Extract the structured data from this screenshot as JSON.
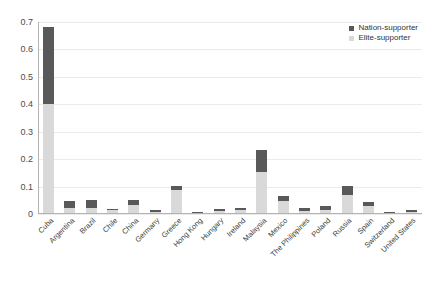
{
  "chart_data": {
    "type": "bar",
    "stacked": true,
    "title": "",
    "subtitle": "",
    "xlabel": "",
    "ylabel": "",
    "ylim": [
      0,
      0.7
    ],
    "ytick_labels": [
      "0",
      "0.1",
      "0.2",
      "0.3",
      "0.4",
      "0.5",
      "0.6",
      "0.7"
    ],
    "ytick_values": [
      0,
      0.1,
      0.2,
      0.3,
      0.4,
      0.5,
      0.6,
      0.7
    ],
    "grid": "horizontal",
    "legend_position": "top-right",
    "categories": [
      "Cuba",
      "Argentina",
      "Brazil",
      "Chile",
      "China",
      "Germany",
      "Greece",
      "Hong Kong",
      "Hungary",
      "Ireland",
      "Malaysia",
      "Mexico",
      "The Philippines",
      "Poland",
      "Russia",
      "Spain",
      "Switzerland",
      "United States"
    ],
    "series": [
      {
        "name": "Elite-supporter",
        "color": "#d9d9d9",
        "values": [
          0.4,
          0.022,
          0.023,
          0.013,
          0.034,
          0.008,
          0.088,
          0.004,
          0.011,
          0.014,
          0.155,
          0.046,
          0.01,
          0.014,
          0.07,
          0.029,
          0.004,
          0.006
        ]
      },
      {
        "name": "Nation-supporter",
        "color": "#595959",
        "values": [
          0.281,
          0.025,
          0.029,
          0.006,
          0.017,
          0.005,
          0.013,
          0.003,
          0.008,
          0.009,
          0.077,
          0.02,
          0.011,
          0.015,
          0.031,
          0.014,
          0.004,
          0.007
        ]
      }
    ],
    "totals": [
      0.681,
      0.047,
      0.052,
      0.019,
      0.051,
      0.013,
      0.101,
      0.007,
      0.019,
      0.023,
      0.232,
      0.066,
      0.021,
      0.029,
      0.101,
      0.043,
      0.008,
      0.013
    ]
  },
  "legend": {
    "items": [
      {
        "label": "Nation-supporter",
        "color": "#595959"
      },
      {
        "label": "Elite-supporter",
        "color": "#d9d9d9"
      }
    ]
  },
  "colors": {
    "nation_supporter": "#595959",
    "elite_supporter": "#d9d9d9",
    "gridline": "#ebebeb",
    "axis": "#b3b3b3",
    "text": "#404040",
    "background": "#ffffff"
  }
}
